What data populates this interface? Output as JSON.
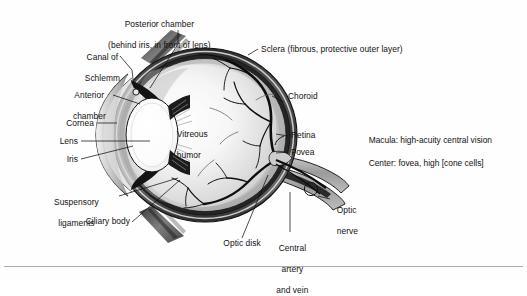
{
  "figure": {
    "type": "anatomical-diagram",
    "background_color": "#fefefe",
    "line_color": "#111111"
  },
  "labels": {
    "posterior_chamber": "Posterior chamber",
    "posterior_chamber_sub": "(behind iris, in front of lens)",
    "canal_of_schlemm_l1": "Canal of",
    "canal_of_schlemm_l2": "Schlemm",
    "anterior_chamber_l1": "Anterior",
    "anterior_chamber_l2": "chamber",
    "cornea": "Cornea",
    "lens": "Lens",
    "iris": "Iris",
    "suspensory_l1": "Suspensory",
    "suspensory_l2": "ligaments",
    "ciliary_body": "Ciliary body",
    "vitreous_l1": "Vitreous",
    "vitreous_l2": "humor",
    "sclera": "Sclera (fibrous, protective outer layer)",
    "choroid": "Choroid",
    "retina": "Retina",
    "fovea": "Fovea",
    "optic_nerve_l1": "Optic",
    "optic_nerve_l2": "nerve",
    "optic_disk": "Optic disk",
    "central_l1": "Central",
    "central_l2": "artery",
    "central_l3": "and vein"
  },
  "annotation": {
    "line1": "Macula: high-acuity central vision",
    "line2": "Center: fovea, high [cone cells]"
  },
  "structures": [
    {
      "name": "sclera",
      "description": "fibrous protective outer layer"
    },
    {
      "name": "choroid",
      "description": "vascular middle layer"
    },
    {
      "name": "retina",
      "description": "inner photoreceptive layer"
    },
    {
      "name": "fovea",
      "description": "center of macula"
    },
    {
      "name": "cornea",
      "description": "transparent front surface"
    },
    {
      "name": "lens",
      "description": "focusing element"
    },
    {
      "name": "iris",
      "description": "pigmented diaphragm"
    },
    {
      "name": "ciliary-body",
      "description": "accommodation muscle"
    },
    {
      "name": "suspensory-ligaments",
      "description": "zonule fibers"
    },
    {
      "name": "vitreous-humor",
      "description": "gel filling posterior cavity"
    },
    {
      "name": "anterior-chamber",
      "description": "aqueous space before iris"
    },
    {
      "name": "posterior-chamber",
      "description": "aqueous space behind iris"
    },
    {
      "name": "canal-of-schlemm",
      "description": "aqueous drainage channel"
    },
    {
      "name": "optic-disk",
      "description": "blind spot"
    },
    {
      "name": "optic-nerve",
      "description": "cranial nerve II"
    },
    {
      "name": "central-artery-and-vein",
      "description": "retinal vessels"
    }
  ]
}
